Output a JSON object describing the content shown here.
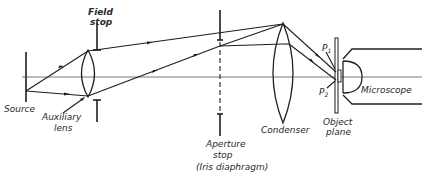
{
  "diagram": {
    "type": "optical-ray-diagram",
    "labels": {
      "source": "Source",
      "auxiliary_lens_line1": "Auxiliary",
      "auxiliary_lens_line2": "lens",
      "field_stop_line1": "Field",
      "field_stop_line2": "stop",
      "aperture_stop_line1": "Aperture",
      "aperture_stop_line2": "stop",
      "aperture_stop_line3": "(Iris diaphragm)",
      "condenser": "Condenser",
      "object_plane_line1": "Object",
      "object_plane_line2": "plane",
      "microscope": "Microscope",
      "p1": "P",
      "p1_sub": "1",
      "p2": "P",
      "p2_sub": "2"
    },
    "components_left_to_right": [
      "Source",
      "Auxiliary lens",
      "Field stop",
      "Aperture stop (Iris diaphragm)",
      "Condenser",
      "Object plane",
      "Microscope"
    ],
    "colors": {
      "ink": "#1e1e1e",
      "background": "#ffffff"
    }
  }
}
